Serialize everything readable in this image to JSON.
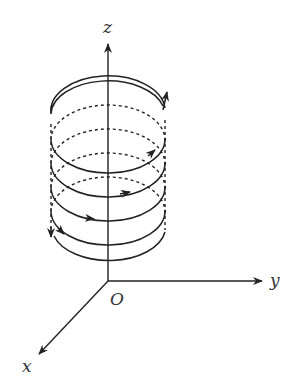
{
  "diagram": {
    "axes": {
      "z_label": "z",
      "y_label": "y",
      "x_label": "x",
      "origin_label": "O"
    },
    "colors": {
      "stroke": "#222222",
      "background": "#ffffff"
    }
  }
}
